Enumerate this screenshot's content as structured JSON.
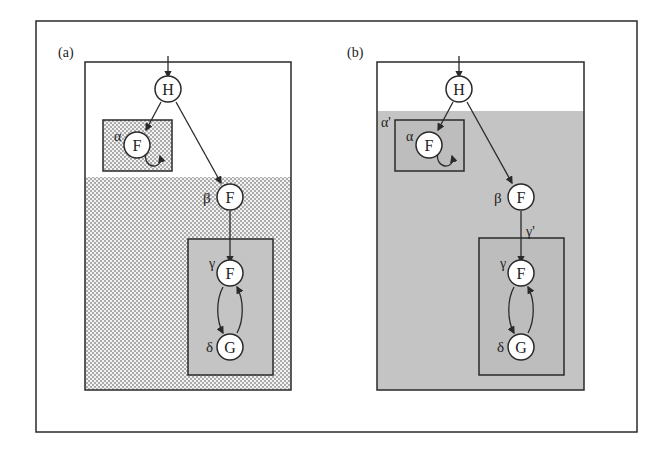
{
  "figure": {
    "panels": [
      {
        "id": "a",
        "label": "(a)",
        "nodes": {
          "H": "H",
          "alpha_F": "F",
          "beta_F": "F",
          "gamma_F": "F",
          "delta_G": "G"
        },
        "greek": {
          "alpha": "α",
          "beta": "β",
          "gamma": "γ",
          "delta": "δ"
        }
      },
      {
        "id": "b",
        "label": "(b)",
        "nodes": {
          "H": "H",
          "alpha_F": "F",
          "beta_F": "F",
          "gamma_F": "F",
          "delta_G": "G"
        },
        "greek": {
          "alpha": "α",
          "alpha_prime": "α'",
          "beta": "β",
          "gamma": "γ",
          "gamma_prime": "γ'",
          "delta": "δ"
        }
      }
    ],
    "colors": {
      "line": "#2a2a2a",
      "dots": "#9a9a9a",
      "gray_fill": "#c4c4c4",
      "inner_gray": "#b8b8b8"
    }
  }
}
